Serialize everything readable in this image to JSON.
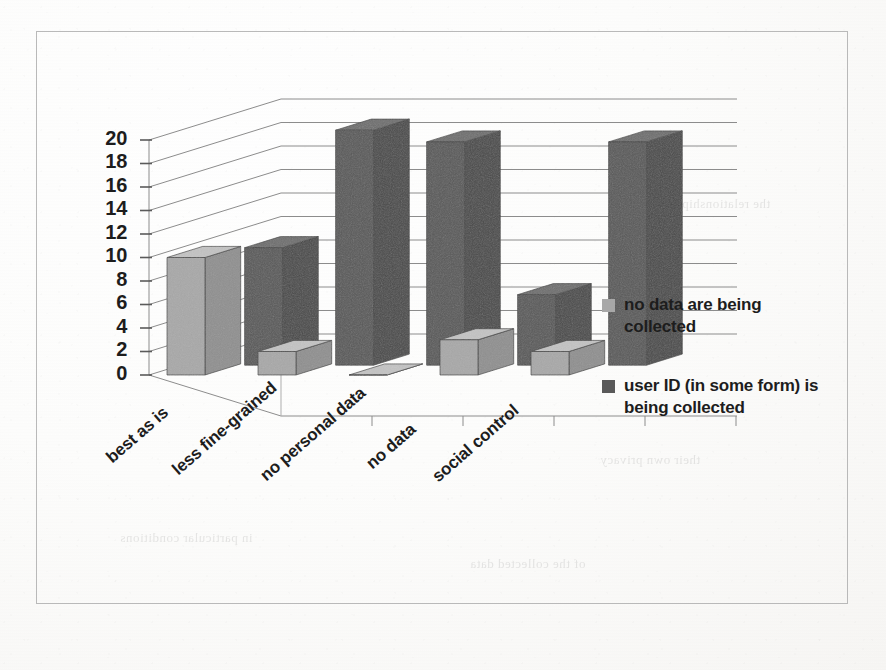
{
  "chart_data": {
    "type": "bar",
    "title": "",
    "subtitle": "",
    "xlabel": "",
    "ylabel": "",
    "ylim": [
      0,
      20
    ],
    "ytick_step": 2,
    "yticks": [
      "20",
      "18",
      "16",
      "14",
      "12",
      "10",
      "8",
      "6",
      "4",
      "2",
      "0"
    ],
    "grid": true,
    "three_d": true,
    "legend_position": "right",
    "categories": [
      "best as is",
      "less fine-grained",
      "no personal data",
      "no data",
      "social control"
    ],
    "series": [
      {
        "name": "no data are being collected",
        "color": "#a8a8a8",
        "values": [
          10,
          2,
          0,
          3,
          2
        ]
      },
      {
        "name": "user ID (in some form) is being collected",
        "color": "#595959",
        "values": [
          10,
          20,
          19,
          6,
          19
        ]
      }
    ]
  },
  "legend": {
    "items": [
      {
        "label": "no data are being collected",
        "color": "#a8a8a8"
      },
      {
        "label": "user ID (in some form) is being collected",
        "color": "#595959"
      }
    ]
  },
  "axis": {
    "y_tick_labels": [
      "20",
      "18",
      "16",
      "14",
      "12",
      "10",
      "8",
      "6",
      "4",
      "2",
      "0"
    ]
  },
  "colors": {
    "series_light_front": "#a8a8a8",
    "series_light_top": "#c3c3c3",
    "series_light_side": "#8f8f8f",
    "series_dark_front": "#595959",
    "series_dark_top": "#6e6e6e",
    "series_dark_side": "#4a4a4a",
    "gridline": "#8c8c8c",
    "frame_border": "#b9b9b9",
    "text": "#1d1d1d"
  }
}
